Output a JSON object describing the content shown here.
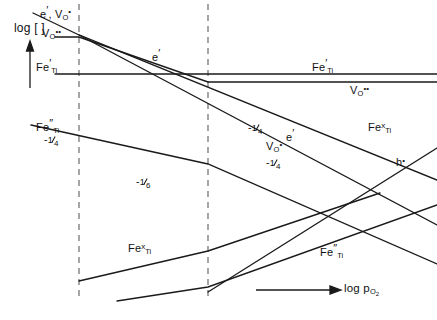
{
  "figure": {
    "type": "brouwer-diagram",
    "width": 437,
    "height": 320,
    "line_color": "#1a1a1a",
    "dash_color": "#6b6b6b",
    "background": "#ffffff"
  },
  "axes": {
    "y_label": "log [ ]",
    "x_label_prefix": "log",
    "x_label_species": "p",
    "x_label_species_sub": "O",
    "x_label_species_sub2": "2",
    "y_arrow": "up-arrow",
    "x_arrow": "right-arrow"
  },
  "regions": {
    "boundary_1_x": 79,
    "boundary_2_x": 208,
    "count": 3,
    "style": "dashed-vertical"
  },
  "labels": [
    {
      "id": "e-prime-VO-top",
      "text_html": "e<span class=\"pr\">&prime;</span>, V<sub>O</sub><sup>&bull;</sup>",
      "plain": "e', V_O^•",
      "x": 40,
      "y": 5
    },
    {
      "id": "VO-dd-left",
      "text_html": "V<sub>O</sub><sup>&bull;&bull;</sup>",
      "plain": "V_O^••",
      "x": 42,
      "y": 28
    },
    {
      "id": "FeTi-prime-left",
      "text_html": "Fe<span class=\"pr\">&prime;</span><sub>Ti</sub>",
      "plain": "Fe'_Ti",
      "x": 36,
      "y": 58
    },
    {
      "id": "FeTi-prime-right",
      "text_html": "Fe<span class=\"pr\">&prime;</span><sub>Ti</sub>",
      "plain": "Fe'_Ti",
      "x": 312,
      "y": 58
    },
    {
      "id": "VO-dd-right",
      "text_html": "V<sub>O</sub><sup>&bull;&bull;</sup>",
      "plain": "V_O^••",
      "x": 350,
      "y": 85
    },
    {
      "id": "e-prime-mid",
      "text_html": "e<span class=\"pr\">&prime;</span>",
      "plain": "e'",
      "x": 152,
      "y": 48
    },
    {
      "id": "e-prime-right",
      "text_html": "e<span class=\"pr\">&prime;</span>",
      "plain": "e'",
      "x": 286,
      "y": 128
    },
    {
      "id": "FeTi-dd-upper",
      "text_html": "Fe<span class=\"pr\">&Prime;</span><sub>Ti</sub>",
      "plain": "Fe''_Ti",
      "x": 36,
      "y": 118
    },
    {
      "id": "FeTi-x-right",
      "text_html": "Fe<sup>x</sup><sub>Ti</sub>",
      "plain": "Fe^x_Ti",
      "x": 368,
      "y": 122
    },
    {
      "id": "h-dot-right",
      "text_html": "h<sup>&bull;</sup>",
      "plain": "h^•",
      "x": 396,
      "y": 157
    },
    {
      "id": "VO-dot-mid",
      "text_html": "V<sub>O</sub><sup>&bull;</sup>",
      "plain": "V_O^•",
      "x": 266,
      "y": 141
    },
    {
      "id": "FeTi-x-bottom",
      "text_html": "Fe<sup>x</sup><sub>Ti</sub>",
      "plain": "Fe^x_Ti",
      "x": 128,
      "y": 243
    },
    {
      "id": "FeTi-dd-bottom",
      "text_html": "Fe<span class=\"pr\">&Prime;</span><sub>Ti</sub>",
      "plain": "Fe''_Ti",
      "x": 320,
      "y": 243
    }
  ],
  "slopes": [
    {
      "id": "slope-quarter-a",
      "num": "1",
      "den": "4",
      "sign": "-",
      "plain": "-1/4",
      "x": 44,
      "y": 134
    },
    {
      "id": "slope-sixth",
      "num": "1",
      "den": "6",
      "sign": "-",
      "plain": "-1/6",
      "x": 136,
      "y": 176
    },
    {
      "id": "slope-quarter-b",
      "num": "1",
      "den": "4",
      "sign": "-",
      "plain": "-1/4",
      "x": 248,
      "y": 122
    },
    {
      "id": "slope-quarter-c",
      "num": "1",
      "den": "4",
      "sign": "-",
      "plain": "-1/4",
      "x": 266,
      "y": 157
    }
  ],
  "chart_data": {
    "type": "line",
    "title": "",
    "xlabel": "log pO2",
    "ylabel": "log [ ]",
    "grid": false,
    "legend": "inline-annotations",
    "xlim": [
      0,
      437
    ],
    "ylim": [
      320,
      0
    ],
    "region_boundaries_x": [
      79,
      208
    ],
    "series": [
      {
        "name": "e' (region I-II-III)",
        "slope_label": "-1/4",
        "points": [
          [
            30,
            14
          ],
          [
            79,
            35
          ],
          [
            208,
            86
          ],
          [
            300,
            122
          ],
          [
            437,
            170
          ]
        ]
      },
      {
        "name": "V_O^•• (flat then -1/4)",
        "slope_label": "-1/4",
        "points": [
          [
            56,
            37
          ],
          [
            79,
            37
          ],
          [
            208,
            82
          ],
          [
            437,
            82
          ]
        ]
      },
      {
        "name": "V_O^• branch",
        "slope_label": "-1/4",
        "points": [
          [
            79,
            35
          ],
          [
            208,
            115
          ],
          [
            300,
            158
          ],
          [
            437,
            215
          ]
        ]
      },
      {
        "name": "Fe'_Ti (flat upper)",
        "slope_label": "0",
        "points": [
          [
            56,
            74
          ],
          [
            208,
            74
          ],
          [
            437,
            74
          ]
        ]
      },
      {
        "name": "Fe''_Ti upper (-1/4 then steeper)",
        "slope_label": "-1/4",
        "points": [
          [
            32,
            126
          ],
          [
            79,
            139
          ],
          [
            208,
            164
          ],
          [
            437,
            266
          ]
        ]
      },
      {
        "name": "Fe^x_Ti rising (bottom)",
        "slope_label": "+",
        "points": [
          [
            79,
            279
          ],
          [
            208,
            250
          ],
          [
            300,
            228
          ],
          [
            380,
            196
          ]
        ]
      },
      {
        "name": "Fe^x_Ti lower rising",
        "slope_label": "+",
        "points": [
          [
            117,
            300
          ],
          [
            208,
            286
          ],
          [
            300,
            262
          ],
          [
            437,
            206
          ]
        ]
      },
      {
        "name": "h^• rising (right)",
        "slope_label": "+1/4",
        "points": [
          [
            208,
            290
          ],
          [
            300,
            214
          ],
          [
            437,
            150
          ]
        ]
      }
    ]
  }
}
